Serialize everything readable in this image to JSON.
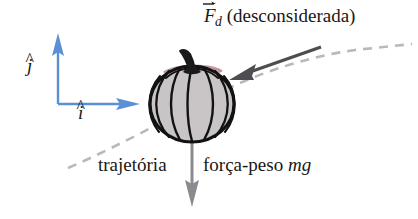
{
  "figure": {
    "background_color": "#ffffff",
    "labels": {
      "drag_force_symbol": "F",
      "drag_force_subscript": "d",
      "drag_force_note": "(desconsiderada)",
      "trajectory": "trajetória",
      "weight_force": "força-peso",
      "weight_force_symbol": "mg",
      "unit_vector_j": "j",
      "unit_vector_i": "i",
      "hat_accent": "^"
    },
    "colors": {
      "axes_blue": "#5b90d4",
      "drag_arrow_gray": "#4e4e52",
      "dashed_gray": "#b9b9bc",
      "weight_arrow_gray": "#8b8b8f",
      "pumpkin_body": "#c9c5c6",
      "pumpkin_outline": "#121212",
      "pumpkin_stem": "#1a1a1a",
      "pumpkin_top_blush": "#b98a91",
      "text_black": "#191714"
    },
    "geometry": {
      "axes_origin": [
        58,
        104
      ],
      "axis_j_tip": [
        58,
        34
      ],
      "axis_i_tip": [
        140,
        104
      ],
      "pumpkin_center": [
        192,
        103
      ],
      "pumpkin_radius_x": 42,
      "pumpkin_radius_y": 39,
      "drag_arrow_tail": [
        320,
        48
      ],
      "drag_arrow_tip": [
        232,
        80
      ],
      "weight_arrow_tail": [
        192,
        140
      ],
      "weight_arrow_tip": [
        192,
        206
      ]
    }
  }
}
